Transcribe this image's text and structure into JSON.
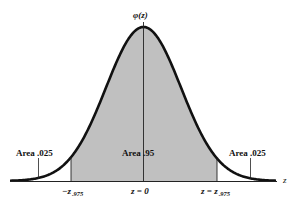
{
  "diagram": {
    "type": "normal-distribution",
    "y_axis_label": "φ(z)",
    "x_axis_label": "z",
    "shaded_color": "#c0c0c0",
    "curve_color": "#111111",
    "areas": {
      "left_tail": "Area .025",
      "center": "Area .95",
      "right_tail": "Area .025"
    },
    "ticks": {
      "left": {
        "prefix": "−z",
        "sub": ".975"
      },
      "center": "z = 0",
      "right": {
        "prefix": "z = z",
        "sub": ".975"
      }
    }
  }
}
